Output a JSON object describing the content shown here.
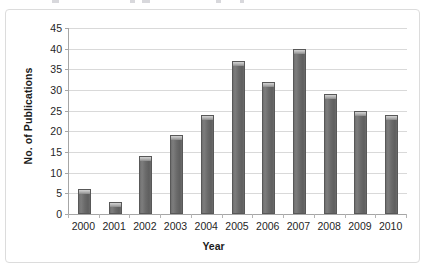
{
  "chart_data": {
    "type": "bar",
    "title": "",
    "xlabel": "Year",
    "ylabel": "No. of Publications",
    "categories": [
      "2000",
      "2001",
      "2002",
      "2003",
      "2004",
      "2005",
      "2006",
      "2007",
      "2008",
      "2009",
      "2010"
    ],
    "values": [
      6,
      3,
      14,
      19,
      24,
      37,
      32,
      40,
      29,
      25,
      24
    ],
    "ylim": [
      0,
      45
    ],
    "ytick_labels": [
      "0",
      "5",
      "10",
      "15",
      "20",
      "25",
      "30",
      "35",
      "40",
      "45"
    ],
    "ytick_values": [
      0,
      5,
      10,
      15,
      20,
      25,
      30,
      35,
      40,
      45
    ],
    "ytick_step": 5,
    "grid": "horizontal",
    "legend": "none",
    "series": [
      {
        "name": "No. of Publications",
        "values": [
          6,
          3,
          14,
          19,
          24,
          37,
          32,
          40,
          29,
          25,
          24
        ]
      }
    ],
    "colors": {
      "bar_fill": "#6a6a6a",
      "bar_edge": "#585858",
      "bar_highlight": "#d3d3d3",
      "gridline": "#d9d9d9",
      "axis_line": "#a6a6a6",
      "panel_border": "#dcdcdc",
      "background": "#ffffff",
      "text": "#1f1f1f"
    }
  }
}
